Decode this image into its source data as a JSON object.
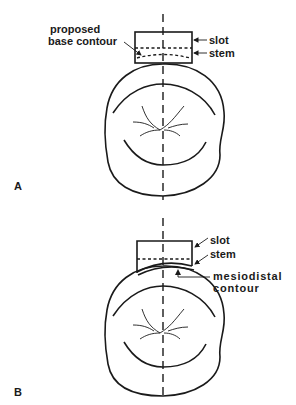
{
  "figure": {
    "panel_a": {
      "label": "A",
      "annotations": {
        "proposed_line1": "proposed",
        "proposed_line2": "base contour",
        "slot": "slot",
        "stem": "stem"
      }
    },
    "panel_b": {
      "label": "B",
      "annotations": {
        "slot": "slot",
        "stem": "stem",
        "mesiodistal_line1": "mesiodistal",
        "mesiodistal_line2": "contour"
      }
    }
  }
}
